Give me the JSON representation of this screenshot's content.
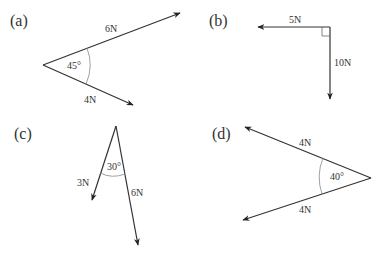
{
  "diagrams": [
    {
      "label": "(a)",
      "vertex": [
        43,
        65
      ],
      "angle_label": "45°",
      "vectors": [
        {
          "magnitude": "6N",
          "tip": [
            180,
            13
          ]
        },
        {
          "magnitude": "4N",
          "tip": [
            133,
            105
          ]
        }
      ]
    },
    {
      "label": "(b)",
      "vertex": [
        330,
        27
      ],
      "angle_label": "right angle",
      "vectors": [
        {
          "magnitude": "5N",
          "tip": [
            258,
            27
          ]
        },
        {
          "magnitude": "10N",
          "tip": [
            330,
            99
          ]
        }
      ]
    },
    {
      "label": "(c)",
      "vertex": [
        116,
        126
      ],
      "angle_label": "30°",
      "vectors": [
        {
          "magnitude": "3N",
          "tip": [
            92,
            200
          ]
        },
        {
          "magnitude": "6N",
          "tip": [
            138,
            245
          ]
        }
      ]
    },
    {
      "label": "(d)",
      "vertex": [
        371,
        178
      ],
      "angle_label": "40°",
      "vectors": [
        {
          "magnitude": "4N",
          "tip": [
            245,
            127
          ]
        },
        {
          "magnitude": "4N",
          "tip": [
            243,
            220
          ]
        }
      ]
    }
  ],
  "colors": {
    "line": "#333333",
    "arc": "#888888"
  }
}
